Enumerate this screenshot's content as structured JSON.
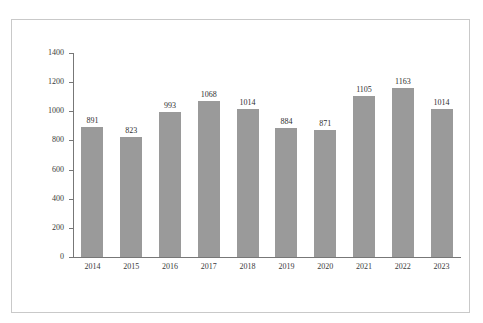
{
  "header": {
    "clipped_text": "—————"
  },
  "chart_data": {
    "type": "bar",
    "title": "",
    "subtitle": "",
    "xlabel": "",
    "ylabel": "",
    "categories": [
      "2014",
      "2015",
      "2016",
      "2017",
      "2018",
      "2019",
      "2020",
      "2021",
      "2022",
      "2023"
    ],
    "values": [
      891,
      823,
      993,
      1068,
      1014,
      884,
      871,
      1105,
      1163,
      1014
    ],
    "data_labels": [
      "891",
      "823",
      "993",
      "1068",
      "1014",
      "884",
      "871",
      "1105",
      "1163",
      "1014"
    ],
    "ylim": [
      0,
      1400
    ],
    "y_ticks": [
      0,
      200,
      400,
      600,
      800,
      1000,
      1200,
      1400
    ],
    "y_tick_labels": [
      "0",
      "200",
      "400",
      "600",
      "800",
      "1000",
      "1200",
      "1400"
    ],
    "grid": false,
    "legend": null,
    "legend_position": "none",
    "bar_color": "#9a9a9a",
    "axis_color": "#777777",
    "text_color": "#2f2f2f",
    "frame_color": "#c9c9c9",
    "background": "#ffffff",
    "annotations": []
  }
}
